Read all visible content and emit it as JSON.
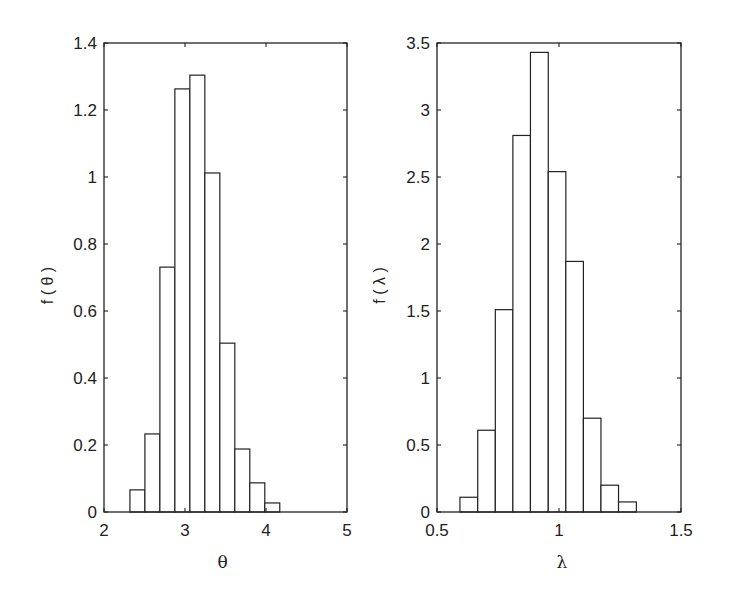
{
  "chart_data": [
    {
      "type": "bar",
      "subtype": "histogram",
      "title": "",
      "xlabel": "θ",
      "ylabel": "f ( θ )",
      "xlim": [
        2,
        5
      ],
      "ylim": [
        0,
        1.4
      ],
      "xticks": [
        2,
        3,
        4,
        5
      ],
      "xtick_labels": [
        "2",
        "3",
        "4",
        "5"
      ],
      "yticks": [
        0,
        0.2,
        0.4,
        0.6,
        0.8,
        1.0,
        1.2,
        1.4
      ],
      "ytick_labels": [
        "0",
        "0.2",
        "0.4",
        "0.6",
        "0.8",
        "1",
        "1.2",
        "1.4"
      ],
      "grid": false,
      "legend": null,
      "bin_edges": [
        2.32,
        2.505,
        2.69,
        2.875,
        3.06,
        3.245,
        3.43,
        3.615,
        3.8,
        3.985,
        4.17
      ],
      "values": [
        0.066,
        0.233,
        0.731,
        1.263,
        1.304,
        1.012,
        0.504,
        0.188,
        0.087,
        0.027
      ],
      "bar_fill": "#ffffff",
      "bar_edge": "#222222"
    },
    {
      "type": "bar",
      "subtype": "histogram",
      "title": "",
      "xlabel": "λ",
      "ylabel": "f ( λ )",
      "xlim": [
        0.5,
        1.5
      ],
      "ylim": [
        0,
        3.5
      ],
      "xticks": [
        0.5,
        1.0,
        1.5
      ],
      "xtick_labels": [
        "0.5",
        "1",
        "1.5"
      ],
      "yticks": [
        0,
        0.5,
        1.0,
        1.5,
        2.0,
        2.5,
        3.0,
        3.5
      ],
      "ytick_labels": [
        "0",
        "0.5",
        "1",
        "1.5",
        "2",
        "2.5",
        "3",
        "3.5"
      ],
      "grid": false,
      "legend": null,
      "bin_edges": [
        0.594,
        0.667,
        0.739,
        0.811,
        0.883,
        0.956,
        1.028,
        1.1,
        1.172,
        1.244,
        1.317
      ],
      "values": [
        0.11,
        0.61,
        1.51,
        2.81,
        3.43,
        2.54,
        1.87,
        0.7,
        0.2,
        0.075
      ],
      "bar_fill": "#ffffff",
      "bar_edge": "#222222"
    }
  ],
  "layout": {
    "panels": [
      {
        "left": 104,
        "right": 347,
        "top": 43,
        "bottom": 512
      },
      {
        "left": 437,
        "right": 681,
        "top": 43,
        "bottom": 512
      }
    ]
  }
}
